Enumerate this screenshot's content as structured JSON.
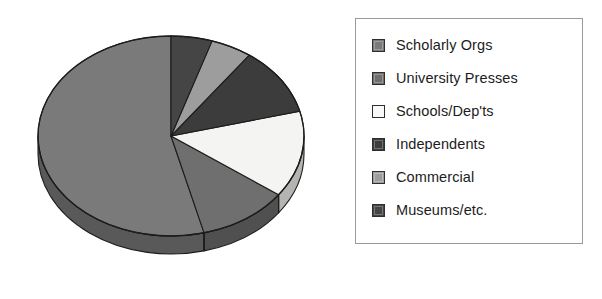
{
  "chart_data": {
    "type": "pie",
    "title": "",
    "subtitle": "",
    "xlabel": "",
    "ylabel": "",
    "grid": false,
    "legend_position": "right",
    "three_d": true,
    "start_angle_deg": 90,
    "direction": "counterclockwise",
    "categories": [
      "Scholarly Orgs",
      "University Presses",
      "Schools/Dep'ts",
      "Independents",
      "Commercial",
      "Museums/etc."
    ],
    "values": [
      54,
      11,
      14,
      11,
      5,
      5
    ],
    "units": "percent",
    "colors": [
      "#7a7a7a",
      "#6f6f6f",
      "#f4f4f2",
      "#3c3c3c",
      "#9d9d9d",
      "#454545"
    ],
    "side_colors": [
      "#595959",
      "#505050",
      "#b4b4b2",
      "#2a2a2a",
      "#757575",
      "#313131"
    ],
    "slices": [
      {
        "label": "Scholarly Orgs",
        "value": 54,
        "color": "#7a7a7a",
        "side_color": "#595959"
      },
      {
        "label": "University Presses",
        "value": 11,
        "color": "#6f6f6f",
        "side_color": "#505050"
      },
      {
        "label": "Schools/Dep'ts",
        "value": 14,
        "color": "#f4f4f2",
        "side_color": "#b4b4b2"
      },
      {
        "label": "Independents",
        "value": 11,
        "color": "#3c3c3c",
        "side_color": "#2a2a2a"
      },
      {
        "label": "Commercial",
        "value": 5,
        "color": "#9d9d9d",
        "side_color": "#757575"
      },
      {
        "label": "Museums/etc.",
        "value": 5,
        "color": "#454545",
        "side_color": "#313131"
      }
    ]
  },
  "legend": {
    "items": [
      {
        "label": "Scholarly Orgs",
        "swatch_color": "#7a7a7a"
      },
      {
        "label": "University Presses",
        "swatch_color": "#6f6f6f"
      },
      {
        "label": "Schools/Dep'ts",
        "swatch_color": "#f8f8f6"
      },
      {
        "label": "Independents",
        "swatch_color": "#3c3c3c"
      },
      {
        "label": "Commercial",
        "swatch_color": "#9d9d9d"
      },
      {
        "label": "Museums/etc.",
        "swatch_color": "#454545"
      }
    ],
    "border_color": "#9a9a9a",
    "background_color": "#ffffff"
  },
  "canvas": {
    "background_color": "#ffffff",
    "outline_color": "#1d1d1d"
  }
}
